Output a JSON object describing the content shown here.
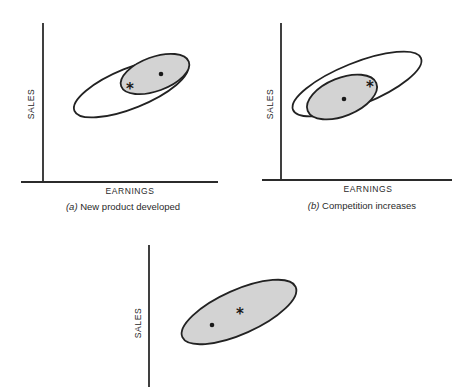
{
  "panels": [
    {
      "id": "a",
      "y_label": "SALES",
      "x_label": "EARNINGS",
      "caption_letter": "(a)",
      "caption_text": " New product developed",
      "markers": {
        "dot": "current position",
        "asterisk": "new position"
      }
    },
    {
      "id": "b",
      "y_label": "SALES",
      "x_label": "EARNINGS",
      "caption_letter": "(b)",
      "caption_text": " Competition increases",
      "markers": {
        "dot": "current position",
        "asterisk": "new position"
      }
    },
    {
      "id": "c",
      "y_label": "SALES",
      "markers": {
        "dot": "current position",
        "asterisk": "new position"
      }
    }
  ],
  "symbols": {
    "asterisk": "*"
  },
  "colors": {
    "line": "#222222",
    "shaded_fill": "#d3d3d3",
    "background": "#ffffff"
  }
}
